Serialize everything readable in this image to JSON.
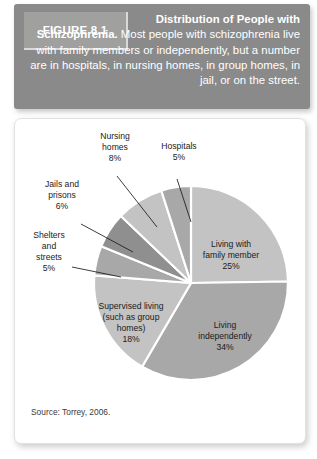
{
  "figure": {
    "tag_label": "FIGURE 8.1",
    "caption_title": "Distribution of People with Schizophrenia.",
    "caption_body": " Most people with schizophrenia live with family members or independently, but a number are in hospitals, in nursing homes, in group homes, in jail, or on the street.",
    "source": "Source: Torrey, 2006."
  },
  "colors": {
    "banner_bg": "#8a8a8a",
    "tag_bg": "#a0a09f",
    "banner_text": "#ffffff",
    "slice_light": "#c3c3c3",
    "slice_medium": "#a8a8a8",
    "slice_dark": "#8f8f8f",
    "separator": "#ffffff",
    "label_text": "#1b1b1b",
    "card_bg": "#ffffff"
  },
  "chart_data": {
    "type": "pie",
    "title": "Distribution of People with Schizophrenia",
    "source": "Source: Torrey, 2006.",
    "start_angle_deg": 0,
    "direction": "clockwise",
    "units": "percent",
    "total": 101,
    "legend": "none",
    "grid": false,
    "categories": [
      "Living with family member",
      "Living independently",
      "Supervised living (such as group homes)",
      "Shelters and streets",
      "Jails and prisons",
      "Nursing homes",
      "Hospitals"
    ],
    "values": [
      25,
      34,
      18,
      5,
      6,
      8,
      5
    ],
    "slices": [
      {
        "label": "Living with family member",
        "label_lines": [
          "Living with",
          "family member",
          "25%"
        ],
        "value": 25,
        "value_text": "25%",
        "color": "#c3c3c3",
        "label_placement": "inside"
      },
      {
        "label": "Living independently",
        "label_lines": [
          "Living",
          "independently",
          "34%"
        ],
        "value": 34,
        "value_text": "34%",
        "color": "#a8a8a8",
        "label_placement": "inside"
      },
      {
        "label": "Supervised living (such as group homes)",
        "label_lines": [
          "Supervised living",
          "(such as group",
          "homes)",
          "18%"
        ],
        "value": 18,
        "value_text": "18%",
        "color": "#c3c3c3",
        "label_placement": "inside"
      },
      {
        "label": "Shelters and streets",
        "label_lines": [
          "Shelters",
          "and",
          "streets",
          "5%"
        ],
        "value": 5,
        "value_text": "5%",
        "color": "#a8a8a8",
        "label_placement": "outside-left"
      },
      {
        "label": "Jails and prisons",
        "label_lines": [
          "Jails and",
          "prisons",
          "6%"
        ],
        "value": 6,
        "value_text": "6%",
        "color": "#8f8f8f",
        "label_placement": "outside-left"
      },
      {
        "label": "Nursing homes",
        "label_lines": [
          "Nursing",
          "homes",
          "8%"
        ],
        "value": 8,
        "value_text": "8%",
        "color": "#c3c3c3",
        "label_placement": "outside-top"
      },
      {
        "label": "Hospitals",
        "label_lines": [
          "Hospitals",
          "5%"
        ],
        "value": 5,
        "value_text": "5%",
        "color": "#a8a8a8",
        "label_placement": "outside-top"
      }
    ]
  }
}
